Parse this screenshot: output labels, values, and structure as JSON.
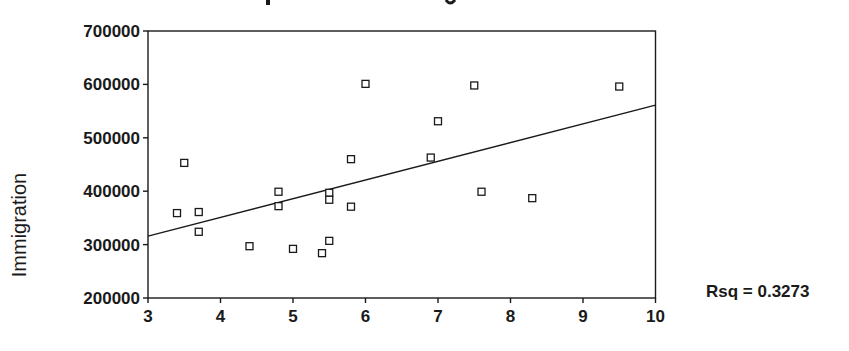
{
  "chart_data": {
    "type": "scatter",
    "title": "",
    "xlabel": "",
    "ylabel": "Immigration",
    "xlim": [
      3,
      10
    ],
    "ylim": [
      200000,
      700000
    ],
    "x_ticks": [
      3,
      4,
      5,
      6,
      7,
      8,
      9,
      10
    ],
    "y_ticks": [
      200000,
      300000,
      400000,
      500000,
      600000,
      700000
    ],
    "y_tick_labels": [
      "200000",
      "300000",
      "400000",
      "500000",
      "600000",
      "700000"
    ],
    "x_tick_labels": [
      "3",
      "4",
      "5",
      "6",
      "7",
      "8",
      "9",
      "10"
    ],
    "grid": false,
    "marker": "open-square",
    "points": [
      {
        "x": 3.4,
        "y": 359000
      },
      {
        "x": 3.5,
        "y": 453000
      },
      {
        "x": 3.7,
        "y": 361000
      },
      {
        "x": 3.7,
        "y": 324000
      },
      {
        "x": 4.4,
        "y": 297000
      },
      {
        "x": 4.8,
        "y": 399000
      },
      {
        "x": 4.8,
        "y": 372000
      },
      {
        "x": 5.0,
        "y": 292000
      },
      {
        "x": 5.4,
        "y": 284000
      },
      {
        "x": 5.5,
        "y": 397000
      },
      {
        "x": 5.5,
        "y": 384000
      },
      {
        "x": 5.5,
        "y": 307000
      },
      {
        "x": 5.8,
        "y": 460000
      },
      {
        "x": 5.8,
        "y": 371000
      },
      {
        "x": 6.0,
        "y": 601000
      },
      {
        "x": 6.9,
        "y": 463000
      },
      {
        "x": 7.0,
        "y": 531000
      },
      {
        "x": 7.5,
        "y": 598000
      },
      {
        "x": 7.6,
        "y": 399000
      },
      {
        "x": 8.3,
        "y": 387000
      },
      {
        "x": 9.5,
        "y": 596000
      }
    ],
    "fit_line": {
      "x0": 3,
      "y0": 316000,
      "x1": 10,
      "y1": 561000
    },
    "annotation": "Rsq = 0.3273"
  },
  "colors": {
    "ink": "#1a1a1a",
    "background": "#ffffff"
  }
}
